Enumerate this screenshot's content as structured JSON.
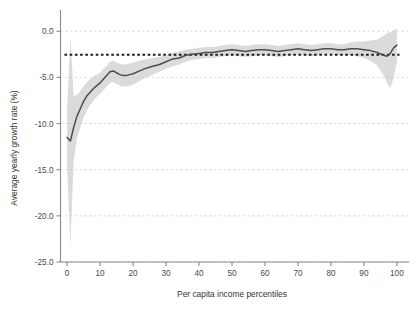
{
  "chart_data": {
    "type": "line",
    "title": "",
    "subtitle": "",
    "xlabel": "Per capita income percentiles",
    "ylabel": "Average yearly growth rate (%)",
    "xlim": [
      -2,
      102
    ],
    "ylim": [
      -25.0,
      1.0
    ],
    "xticks": [
      0,
      10,
      20,
      30,
      40,
      50,
      60,
      70,
      80,
      90,
      100
    ],
    "xtick_labels": [
      "0",
      "10",
      "20",
      "30",
      "40",
      "50",
      "60",
      "70",
      "80",
      "90",
      "100"
    ],
    "yticks": [
      0.0,
      -5.0,
      -10.0,
      -15.0,
      -20.0,
      -25.0
    ],
    "ytick_labels": [
      "0.0",
      "-5.0",
      "-10.0",
      "-15.0",
      "-20.0",
      "-25.0"
    ],
    "grid": true,
    "grid_axis": "y",
    "grid_style": "dashed",
    "grid_color": "#d9d9d9",
    "legend": "none",
    "reference_line": {
      "name": "overall-average",
      "orientation": "horizontal",
      "value": -2.55,
      "style": "dotted",
      "color": "#1a1a1a"
    },
    "series": [
      {
        "name": "Average yearly growth rate",
        "style": "line",
        "color": "#4d4d4d",
        "x": [
          0,
          1,
          2,
          3,
          4,
          5,
          6,
          7,
          8,
          9,
          10,
          11,
          12,
          13,
          14,
          15,
          16,
          17,
          18,
          19,
          20,
          22,
          24,
          26,
          28,
          30,
          32,
          34,
          36,
          38,
          40,
          42,
          44,
          46,
          48,
          50,
          52,
          54,
          56,
          58,
          60,
          62,
          64,
          66,
          68,
          70,
          72,
          74,
          76,
          78,
          80,
          82,
          84,
          86,
          88,
          90,
          92,
          94,
          96,
          97,
          98,
          99,
          100
        ],
        "y": [
          -11.5,
          -11.9,
          -10.4,
          -9.2,
          -8.4,
          -7.6,
          -7.0,
          -6.6,
          -6.2,
          -5.9,
          -5.6,
          -5.2,
          -4.8,
          -4.4,
          -4.3,
          -4.5,
          -4.7,
          -4.8,
          -4.8,
          -4.7,
          -4.6,
          -4.3,
          -4.0,
          -3.8,
          -3.6,
          -3.3,
          -3.0,
          -2.9,
          -2.6,
          -2.5,
          -2.4,
          -2.3,
          -2.3,
          -2.2,
          -2.1,
          -2.0,
          -2.1,
          -2.2,
          -2.1,
          -2.0,
          -2.0,
          -2.1,
          -2.2,
          -2.1,
          -2.0,
          -1.9,
          -2.0,
          -2.1,
          -2.0,
          -1.9,
          -1.9,
          -2.0,
          -2.0,
          -1.9,
          -1.9,
          -2.0,
          -2.1,
          -2.3,
          -2.6,
          -2.7,
          -2.4,
          -1.8,
          -1.5
        ]
      }
    ],
    "confidence_band": {
      "name": "confidence-interval",
      "color": "#c8c8c8",
      "opacity": 0.65,
      "x": [
        0,
        1,
        2,
        3,
        4,
        5,
        6,
        7,
        8,
        9,
        10,
        11,
        12,
        13,
        14,
        15,
        16,
        17,
        18,
        19,
        20,
        22,
        24,
        26,
        28,
        30,
        32,
        34,
        36,
        38,
        40,
        42,
        44,
        46,
        48,
        50,
        52,
        54,
        56,
        58,
        60,
        62,
        64,
        66,
        68,
        70,
        72,
        74,
        76,
        78,
        80,
        82,
        84,
        86,
        88,
        90,
        92,
        94,
        96,
        97,
        98,
        99,
        100
      ],
      "lower": [
        -14.6,
        -23.3,
        -14.0,
        -11.6,
        -10.4,
        -9.4,
        -8.6,
        -8.0,
        -7.5,
        -7.1,
        -6.8,
        -6.4,
        -6.0,
        -5.6,
        -5.5,
        -5.7,
        -5.9,
        -6.0,
        -6.0,
        -5.9,
        -5.8,
        -5.4,
        -5.0,
        -4.7,
        -4.4,
        -4.1,
        -3.8,
        -3.6,
        -3.3,
        -3.1,
        -3.0,
        -2.9,
        -2.9,
        -2.8,
        -2.7,
        -2.6,
        -2.7,
        -2.8,
        -2.7,
        -2.6,
        -2.6,
        -2.7,
        -2.8,
        -2.7,
        -2.6,
        -2.5,
        -2.6,
        -2.7,
        -2.6,
        -2.5,
        -2.5,
        -2.6,
        -2.6,
        -2.6,
        -2.7,
        -2.9,
        -3.2,
        -3.7,
        -4.8,
        -5.6,
        -6.2,
        -5.0,
        -3.3
      ],
      "upper": [
        -8.4,
        -0.6,
        -7.0,
        -6.9,
        -6.5,
        -6.0,
        -5.5,
        -5.2,
        -4.9,
        -4.7,
        -4.5,
        -4.1,
        -3.7,
        -3.3,
        -3.2,
        -3.4,
        -3.5,
        -3.6,
        -3.6,
        -3.5,
        -3.4,
        -3.2,
        -3.0,
        -2.9,
        -2.8,
        -2.6,
        -2.3,
        -2.2,
        -2.0,
        -1.9,
        -1.8,
        -1.7,
        -1.7,
        -1.6,
        -1.5,
        -1.4,
        -1.5,
        -1.6,
        -1.5,
        -1.4,
        -1.4,
        -1.5,
        -1.6,
        -1.5,
        -1.4,
        -1.3,
        -1.4,
        -1.5,
        -1.4,
        -1.3,
        -1.3,
        -1.4,
        -1.4,
        -1.2,
        -1.1,
        -1.1,
        -1.0,
        -0.9,
        -0.5,
        -0.2,
        -0.1,
        0.1,
        0.3
      ]
    }
  },
  "caption": {
    "partial_text": ""
  }
}
